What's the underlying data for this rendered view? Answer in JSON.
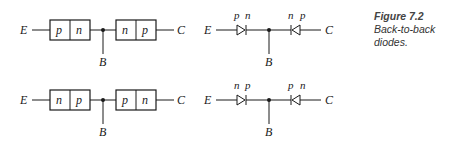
{
  "caption": {
    "figure_label": "Figure 7.2",
    "description": "Back-to-back diodes."
  },
  "rows": [
    {
      "block": {
        "left_terminal": "E",
        "right_terminal": "C",
        "base_terminal": "B",
        "left_junction": [
          "p",
          "n"
        ],
        "right_junction": [
          "n",
          "p"
        ]
      },
      "diode": {
        "left_terminal": "E",
        "right_terminal": "C",
        "base_terminal": "B",
        "left_diode_labels": [
          "p",
          "n"
        ],
        "right_diode_labels": [
          "n",
          "p"
        ]
      }
    },
    {
      "block": {
        "left_terminal": "E",
        "right_terminal": "C",
        "base_terminal": "B",
        "left_junction": [
          "n",
          "p"
        ],
        "right_junction": [
          "p",
          "n"
        ]
      },
      "diode": {
        "left_terminal": "E",
        "right_terminal": "C",
        "base_terminal": "B",
        "left_diode_labels": [
          "n",
          "p"
        ],
        "right_diode_labels": [
          "p",
          "n"
        ]
      }
    }
  ]
}
